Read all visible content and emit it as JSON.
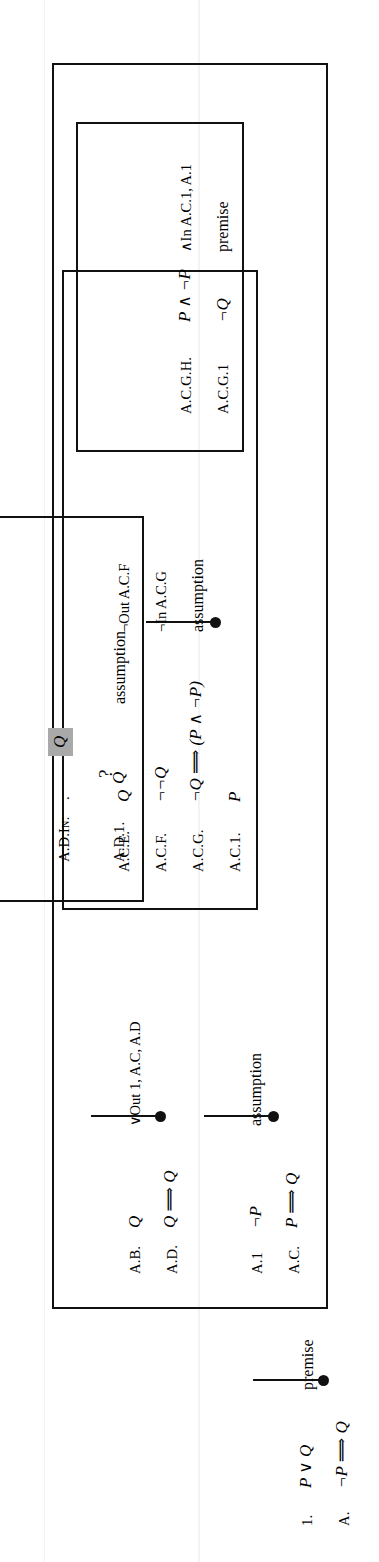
{
  "document": {
    "kind": "fitch-style natural deduction proof",
    "orientation": "rotated 90 degrees counter-clockwise",
    "highlight_color": "#a9a9a9",
    "ink_color": "#111111",
    "page_background": "#ffffff"
  },
  "proof": {
    "root_lines": [
      {
        "label": "1.",
        "formula": "P ∨ Q",
        "justification": ""
      },
      {
        "label": "A.",
        "formula": "¬P ⟹ Q",
        "justification": "premise"
      }
    ],
    "level1": {
      "marker": "premise",
      "lines": [
        {
          "label": "A.1",
          "formula": "¬P",
          "justification": ""
        },
        {
          "label": "A.C.",
          "formula": "P ⟹ Q",
          "justification": "assumption"
        },
        {
          "label": "A.D.",
          "formula": "Q ⟹ Q",
          "justification": ""
        },
        {
          "label": "A.B.",
          "formula": "Q",
          "justification": "∨Out 1, A.C, A.D"
        }
      ]
    },
    "level2_AC": {
      "marker": "assumption",
      "lines": [
        {
          "label": "A.C.1.",
          "formula": "P",
          "justification": ""
        },
        {
          "label": "A.C.G.",
          "formula": "¬Q ⟹ (P ∧ ¬P)",
          "justification": ""
        },
        {
          "label": "A.C.F.",
          "formula": "¬¬Q",
          "justification": "¬In A.C.G"
        },
        {
          "label": "A.C.E.",
          "formula": "Q",
          "justification": "¬Out A.C.F"
        }
      ]
    },
    "level3_ACG": {
      "lines": [
        {
          "label": "A.C.G.1",
          "formula": "¬Q",
          "justification": "premise"
        },
        {
          "label": "A.C.G.H.",
          "formula": "P ∧ ¬P",
          "justification": "∧In A.C.1, A.1"
        }
      ]
    },
    "level2_AD": {
      "marker": "assumption",
      "lines": [
        {
          "label": "A.D.1.",
          "formula": "Q",
          "justification": "assumption"
        },
        {
          "label": "A.D.In:",
          "formula": ".",
          "query": "?",
          "selected_formula": "Q",
          "justification": ""
        }
      ]
    }
  }
}
